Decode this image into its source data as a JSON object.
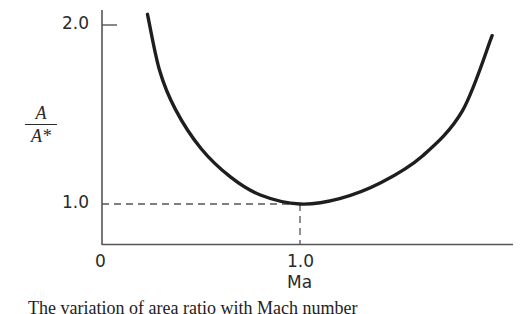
{
  "chart_data": {
    "type": "line",
    "title": "",
    "xlabel": "Ma",
    "ylabel": "A/A*",
    "ylabel_parts": {
      "numerator": "A",
      "denominator": "A*"
    },
    "x_ticks": [
      {
        "value": 0,
        "label": "0"
      },
      {
        "value": 1.0,
        "label": "1.0"
      }
    ],
    "y_ticks": [
      {
        "value": 1.0,
        "label": "1.0"
      },
      {
        "value": 2.0,
        "label": "2.0"
      }
    ],
    "xlim": [
      0,
      2.07
    ],
    "ylim": [
      0.78,
      2.1
    ],
    "grid": false,
    "legend": null,
    "reference_lines": [
      {
        "type": "horizontal",
        "y": 1.0,
        "from_x": 0,
        "to_x": 1.0,
        "style": "dashed"
      },
      {
        "type": "vertical",
        "x": 1.0,
        "from_y": 0.78,
        "to_y": 1.0,
        "style": "dashed"
      }
    ],
    "series": [
      {
        "name": "A/A*",
        "x": [
          0.23,
          0.29,
          0.37,
          0.5,
          0.65,
          0.8,
          1.0,
          1.2,
          1.41,
          1.62,
          1.82,
          1.97
        ],
        "values": [
          2.06,
          1.75,
          1.53,
          1.31,
          1.15,
          1.05,
          1.0,
          1.03,
          1.12,
          1.27,
          1.52,
          1.94
        ]
      }
    ],
    "annotations": [
      {
        "text": "Minimum A/A* = 1.0 at Ma = 1.0"
      }
    ]
  },
  "figure": {
    "caption": "The variation of area ratio with Mach number"
  }
}
